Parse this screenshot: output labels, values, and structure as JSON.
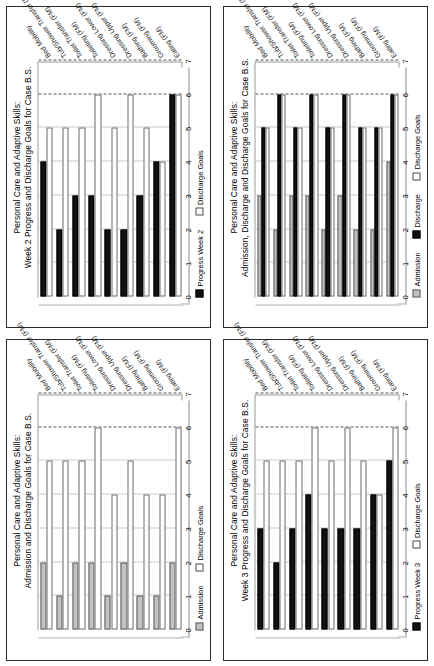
{
  "figure": {
    "categories": [
      "Eating (FM)",
      "Grooming (FM)",
      "Bathing (FM)",
      "Dressing Upper (FM)",
      "Dressing Lower (FM)",
      "Toileting (FM)",
      "Toilet Transfer (FM)",
      "Tub/Shower Transfer (FM)",
      "Bed Mobility"
    ],
    "axis_ticks": [
      "0",
      "1",
      "2",
      "3",
      "4",
      "5",
      "6",
      "7"
    ],
    "axis_min": 0,
    "axis_max": 7,
    "colors": {
      "black": "#111111",
      "gray": "#c2c2c2",
      "white": "#ffffff",
      "border": "#3a3a3a"
    }
  },
  "charts": [
    {
      "id": "week2",
      "chart_data": {
        "type": "bar",
        "title": "Personal Care and Adaptive Skills: Week 2 Progress and Discharge Goals for Case B.S.",
        "title_line1": "Personal Care and Adaptive Skills:",
        "title_line2": "Week 2 Progress and Discharge Goals for Case B.S.",
        "xlabel": "",
        "ylabel": "",
        "ylim": [
          0,
          7
        ],
        "grid": true,
        "legend_position": "bottom",
        "categories": [
          "Eating (FM)",
          "Grooming (FM)",
          "Bathing (FM)",
          "Dressing Upper (FM)",
          "Dressing Lower (FM)",
          "Toileting (FM)",
          "Toilet Transfer (FM)",
          "Tub/Shower Transfer (FM)",
          "Bed Mobility"
        ],
        "series": [
          {
            "name": "Progress Week 2",
            "fill": "black",
            "values": [
              6,
              4,
              3,
              2,
              2,
              3,
              3,
              2,
              4
            ]
          },
          {
            "name": "Discharge Goals",
            "fill": "white",
            "values": [
              6,
              4,
              5,
              6,
              5,
              6,
              5,
              5,
              5
            ]
          }
        ],
        "legend": [
          {
            "label": "Progress Week 2",
            "fill": "black"
          },
          {
            "label": "Discharge Goals",
            "fill": "white"
          }
        ]
      }
    },
    {
      "id": "admission-discharge",
      "chart_data": {
        "type": "bar",
        "title": "Personal Care and Adaptive Skills: Admission, Discharge and Discharge Goals for Case B.S.",
        "title_line1": "Personal Care and Adaptive Skills:",
        "title_line2": "Admission, Discharge and Discharge Goals for Case B.S.",
        "xlabel": "",
        "ylabel": "",
        "ylim": [
          0,
          7
        ],
        "grid": true,
        "legend_position": "bottom",
        "categories": [
          "Eating (FM)",
          "Grooming (FM)",
          "Bathing (FM)",
          "Dressing Upper (FM)",
          "Dressing Lower (FM)",
          "Toileting (FM)",
          "Toilet Transfer (FM)",
          "Tub/Shower Transfer (FM)",
          "Bed Mobility"
        ],
        "series": [
          {
            "name": "Admission",
            "fill": "gray",
            "values": [
              4,
              2,
              2,
              3,
              2,
              3,
              3,
              2,
              3
            ]
          },
          {
            "name": "Discharge",
            "fill": "black",
            "values": [
              6,
              5,
              5,
              6,
              5,
              6,
              5,
              6,
              5
            ]
          },
          {
            "name": "Discharge Goals",
            "fill": "white",
            "values": [
              6,
              5,
              5,
              6,
              5,
              6,
              5,
              6,
              5
            ]
          }
        ],
        "legend": [
          {
            "label": "Admission",
            "fill": "gray"
          },
          {
            "label": "Discharge",
            "fill": "black"
          },
          {
            "label": "Discharge Goals",
            "fill": "white"
          }
        ]
      }
    },
    {
      "id": "admission-goals",
      "chart_data": {
        "type": "bar",
        "title": "Personal Care and Adaptive Skills: Admission and Discharge Goals for Case B.S.",
        "title_line1": "Personal Care and Adaptive Skills:",
        "title_line2": "Admission and Discharge Goals for Case B.S.",
        "xlabel": "",
        "ylabel": "",
        "ylim": [
          0,
          7
        ],
        "grid": true,
        "legend_position": "bottom",
        "categories": [
          "Eating (FM)",
          "Grooming (FM)",
          "Bathing (FM)",
          "Dressing Upper (FM)",
          "Dressing Lower (FM)",
          "Toileting (FM)",
          "Toilet Transfer (FM)",
          "Tub/Shower Transfer (FM)",
          "Bed Mobility"
        ],
        "series": [
          {
            "name": "Admission",
            "fill": "gray",
            "values": [
              2,
              1,
              1,
              2,
              1,
              2,
              2,
              1,
              2
            ]
          },
          {
            "name": "Discharge Goals",
            "fill": "white",
            "values": [
              6,
              4,
              4,
              5,
              4,
              6,
              5,
              5,
              5
            ]
          }
        ],
        "legend": [
          {
            "label": "Admission",
            "fill": "gray"
          },
          {
            "label": "Discharge Goals",
            "fill": "white"
          }
        ]
      }
    },
    {
      "id": "week3",
      "chart_data": {
        "type": "bar",
        "title": "Personal Care and Adaptive Skills: Week 3 Progress and Discharge Goals for Case B.S.",
        "title_line1": "Personal Care and Adaptive Skills:",
        "title_line2": "Week 3 Progress and Discharge Goals for Case B.S.",
        "xlabel": "",
        "ylabel": "",
        "ylim": [
          0,
          7
        ],
        "grid": true,
        "legend_position": "bottom",
        "categories": [
          "Eating (FM)",
          "Grooming (FM)",
          "Bathing (FM)",
          "Dressing Upper (FM)",
          "Dressing Lower (FM)",
          "Toileting (FM)",
          "Toilet Transfer (FM)",
          "Tub/Shower Transfer (FM)",
          "Bed Mobility"
        ],
        "series": [
          {
            "name": "Progress Week 3",
            "fill": "black",
            "values": [
              5,
              4,
              3,
              3,
              3,
              4,
              3,
              2,
              3
            ]
          },
          {
            "name": "Discharge Goals",
            "fill": "white",
            "values": [
              6,
              4,
              5,
              6,
              5,
              6,
              5,
              5,
              5
            ]
          }
        ],
        "legend": [
          {
            "label": "Progress Week 3",
            "fill": "black"
          },
          {
            "label": "Discharge Goals",
            "fill": "white"
          }
        ]
      }
    }
  ]
}
